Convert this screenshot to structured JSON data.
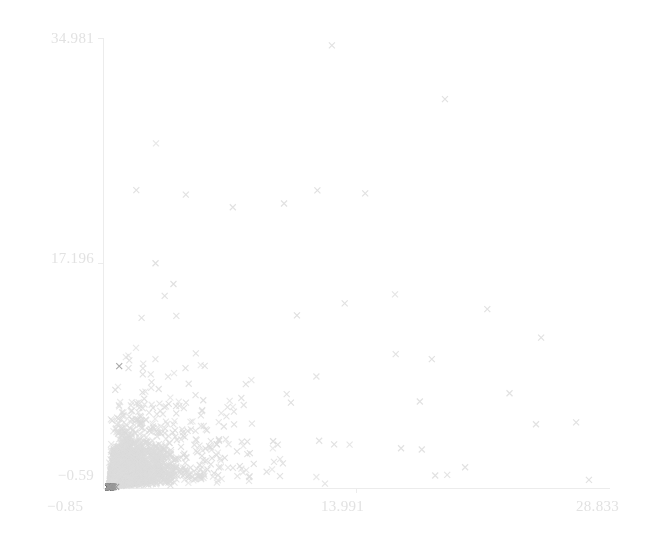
{
  "chart_data": {
    "type": "scatter",
    "title": "",
    "xlabel": "",
    "ylabel": "",
    "marker": "x",
    "grid": false,
    "legend": null,
    "background_color": "#ffffff",
    "axis_color": "#ececec",
    "tick_label_color": "#e2e2e2",
    "xlim": [
      -0.85,
      28.833
    ],
    "ylim": [
      -0.59,
      34.981
    ],
    "xticks": [
      -0.85,
      13.991,
      28.833
    ],
    "xtick_labels": [
      "−0.85",
      "13.991",
      "28.833"
    ],
    "yticks": [
      -0.59,
      17.196,
      34.981
    ],
    "ytick_labels": [
      "−0.59",
      "17.196",
      "34.981"
    ],
    "series": [
      {
        "name": "group-light",
        "color": "#dcdcdc",
        "n_points": 2600,
        "marker_size": 6.0,
        "distribution": "lognormal-cloud",
        "x_center": 1.05,
        "y_center": 1.05,
        "x_spread": 0.95,
        "y_spread": 0.95,
        "correlation": 0.45,
        "seed": 20240511
      },
      {
        "name": "group-dark",
        "color": "#9a9a9a",
        "n_points": 1500,
        "marker_size": 6.0,
        "distribution": "lognormal-cloud",
        "x_center": 0.05,
        "y_center": 0.0,
        "x_spread": 0.62,
        "y_spread": 0.58,
        "correlation": 0.3,
        "seed": 777123
      }
    ],
    "outliers": [
      {
        "x": 12.55,
        "y": 34.4,
        "series": "group-light"
      },
      {
        "x": 19.17,
        "y": 30.15,
        "series": "group-light"
      },
      {
        "x": 14.5,
        "y": 22.7,
        "series": "group-light"
      },
      {
        "x": 1.1,
        "y": 22.95,
        "series": "group-light"
      },
      {
        "x": 4.0,
        "y": 22.6,
        "series": "group-light"
      },
      {
        "x": 6.75,
        "y": 21.6,
        "series": "group-light"
      },
      {
        "x": 9.75,
        "y": 21.9,
        "series": "group-light"
      },
      {
        "x": 21.65,
        "y": 13.55,
        "series": "group-light"
      },
      {
        "x": 24.8,
        "y": 11.3,
        "series": "group-light"
      },
      {
        "x": 22.95,
        "y": 6.9,
        "series": "group-light"
      },
      {
        "x": 26.85,
        "y": 4.6,
        "series": "group-light"
      },
      {
        "x": 24.5,
        "y": 4.45,
        "series": "group-light"
      },
      {
        "x": 27.6,
        "y": 0.05,
        "series": "group-light"
      },
      {
        "x": 18.6,
        "y": 0.4,
        "series": "group-light"
      },
      {
        "x": 20.35,
        "y": 1.05,
        "series": "group-light"
      },
      {
        "x": 16.6,
        "y": 2.55,
        "series": "group-light"
      },
      {
        "x": 17.7,
        "y": 6.25,
        "series": "group-light"
      },
      {
        "x": 18.4,
        "y": 9.6,
        "series": "group-light"
      },
      {
        "x": 13.3,
        "y": 14.0,
        "series": "group-light"
      },
      {
        "x": 0.1,
        "y": 9.05,
        "series": "group-dark"
      }
    ]
  },
  "axes": {
    "y_top_label": "34.981",
    "y_mid_label": "17.196",
    "y_bottom_label": "−0.59",
    "x_left_label": "−0.85",
    "x_mid_label": "13.991",
    "x_right_label": "28.833"
  }
}
